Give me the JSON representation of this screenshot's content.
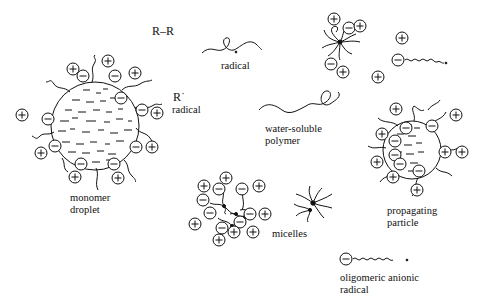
{
  "diagram": {
    "colors": {
      "ink": "#111111",
      "background": "#ffffff"
    },
    "labels": {
      "initiator": "R–R",
      "radical_r": "R˙",
      "radical_r_caption": "radical",
      "radical_chain": "radical",
      "water_soluble_line1": "water-soluble",
      "water_soluble_line2": "polymer",
      "monomer_line1": "monomer",
      "monomer_line2": "droplet",
      "micelles": "micelles",
      "propagating_line1": "propagating",
      "propagating_line2": "particle",
      "oligomeric_line1": "oligomeric anionic",
      "oligomeric_line2": "radical"
    },
    "symbols": {
      "plus": "+",
      "minus": "−"
    },
    "elements": [
      {
        "name": "initiator",
        "label": "R–R"
      },
      {
        "name": "primary-radical",
        "label": "R˙ radical"
      },
      {
        "name": "radical-chain",
        "label": "radical"
      },
      {
        "name": "water-soluble-polymer",
        "label": "water-soluble polymer"
      },
      {
        "name": "monomer-droplet",
        "label": "monomer droplet"
      },
      {
        "name": "micelles",
        "label": "micelles"
      },
      {
        "name": "propagating-particle",
        "label": "propagating particle"
      },
      {
        "name": "oligomeric-anionic-radical",
        "label": "oligomeric anionic radical"
      }
    ]
  }
}
